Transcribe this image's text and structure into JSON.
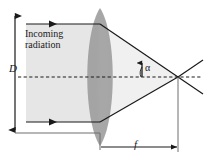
{
  "figure": {
    "type": "optics-ray-diagram",
    "background_color": "#ffffff",
    "line_color": "#1a1a1a",
    "lens_color": "#9a9a9a",
    "beam_color": "#e3e3e3",
    "cone_color": "#efefef",
    "labels": {
      "incoming": "Incoming\nradiation",
      "aperture": "D",
      "angle": "α",
      "focal_length": "f"
    },
    "icons": {
      "aperture_dimension": "double-arrow-vertical-icon",
      "focal_dimension": "arrow-right-icon",
      "ray_direction": "arrowhead-right-icon",
      "angle_marker": "angle-arc-icon"
    },
    "geometry": {
      "optical_axis_y": 77,
      "lens_center_x": 100,
      "focal_point": {
        "x": 178,
        "y": 77
      },
      "upper_ray_y": 24,
      "lower_ray_y": 122,
      "aperture_line_x": 15,
      "aperture_top_y": 12,
      "aperture_bottom_y": 133,
      "focal_dimension_y": 147,
      "beam_left_x": 26
    }
  }
}
